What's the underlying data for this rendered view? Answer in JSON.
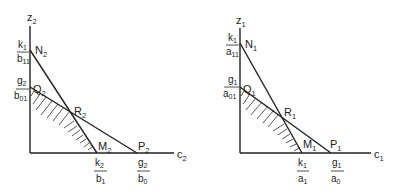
{
  "figure": {
    "panels": [
      {
        "id": "left",
        "axes": {
          "y_label": "z",
          "y_sub": "2",
          "x_label": "c",
          "x_sub": "2"
        },
        "points": {
          "N": {
            "name": "N",
            "sub": "2"
          },
          "Q": {
            "name": "Q",
            "sub": "2"
          },
          "R": {
            "name": "R",
            "sub": "2"
          },
          "M": {
            "name": "M",
            "sub": "2"
          },
          "P": {
            "name": "P",
            "sub": "2"
          }
        },
        "y_ticks": [
          {
            "num": "k",
            "num_sub": "1",
            "den": "b",
            "den_sub": "11"
          },
          {
            "num": "g",
            "num_sub": "2",
            "den": "b",
            "den_sub": "01"
          }
        ],
        "x_ticks": [
          {
            "num": "k",
            "num_sub": "2",
            "den": "b",
            "den_sub": "1"
          },
          {
            "num": "g",
            "num_sub": "2",
            "den": "b",
            "den_sub": "0"
          }
        ]
      },
      {
        "id": "right",
        "axes": {
          "y_label": "z",
          "y_sub": "1",
          "x_label": "c",
          "x_sub": "1"
        },
        "points": {
          "N": {
            "name": "N",
            "sub": "1"
          },
          "Q": {
            "name": "Q",
            "sub": "1"
          },
          "R": {
            "name": "R",
            "sub": "1"
          },
          "M": {
            "name": "M",
            "sub": "1"
          },
          "P": {
            "name": "P",
            "sub": "1"
          }
        },
        "y_ticks": [
          {
            "num": "k",
            "num_sub": "1",
            "den": "a",
            "den_sub": "11"
          },
          {
            "num": "g",
            "num_sub": "1",
            "den": "a",
            "den_sub": "01"
          }
        ],
        "x_ticks": [
          {
            "num": "k",
            "num_sub": "1",
            "den": "a",
            "den_sub": "1"
          },
          {
            "num": "g",
            "num_sub": "1",
            "den": "a",
            "den_sub": "0"
          }
        ]
      }
    ]
  }
}
